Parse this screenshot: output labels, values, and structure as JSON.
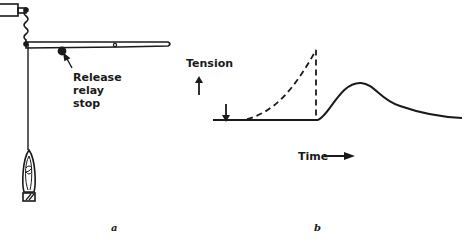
{
  "diagram": {
    "panel_a": {
      "label": "a",
      "annotation_lines": [
        "Release",
        "relay",
        "stop"
      ],
      "components": [
        "clamp",
        "spring",
        "lever",
        "pivot",
        "release-relay-stop",
        "thread",
        "muscle",
        "weight-block"
      ]
    },
    "panel_b": {
      "label": "b",
      "y_axis_label": "Tension",
      "x_axis_label": "Time",
      "stimulus_marker": "down-arrow",
      "curves": [
        {
          "name": "isometric-release-tension",
          "style": "dashed",
          "description": "rises steeply then drops vertically at release"
        },
        {
          "name": "subsequent-tension",
          "style": "solid",
          "description": "baseline, then rises to a rounded peak and decays"
        }
      ]
    },
    "colors": {
      "ink": "#1a1a1a",
      "background": "#ffffff"
    }
  }
}
